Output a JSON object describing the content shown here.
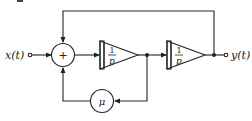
{
  "diagram": {
    "type": "block-diagram",
    "input_label": "x(t)",
    "output_label": "y(t)",
    "summer": {
      "symbol": "+"
    },
    "integrator_1": {
      "numerator": "1",
      "denominator": "p"
    },
    "integrator_2": {
      "numerator": "1",
      "denominator": "p"
    },
    "gain_block": {
      "symbol": "μ"
    },
    "connections": [
      "x(t) -> summer",
      "summer -> integrator_1",
      "integrator_1 -> integrator_2",
      "integrator_2 -> y(t)",
      "y(t) -> summer (top feedback)",
      "integrator_1 output -> μ -> summer (bottom feedback)"
    ]
  },
  "colors": {
    "stroke": "#222222",
    "background": "#ffffff"
  }
}
